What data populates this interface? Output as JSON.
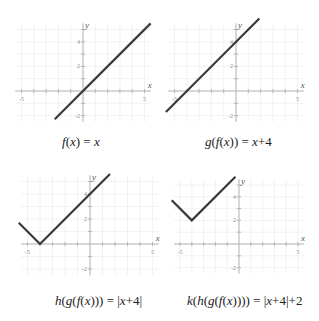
{
  "chart_data": [
    {
      "type": "line",
      "id": "f",
      "title": "f(x) = x",
      "caption_parts": [
        {
          "t": "f",
          "i": true
        },
        {
          "t": "(",
          "i": false
        },
        {
          "t": "x",
          "i": true
        },
        {
          "t": ") = ",
          "i": false
        },
        {
          "t": "x",
          "i": true
        }
      ],
      "xlabel": "x",
      "ylabel": "y",
      "xlim": [
        -5.5,
        5.5
      ],
      "ylim": [
        -2.5,
        5.5
      ],
      "xticks": [
        -5,
        -4,
        -3,
        -2,
        -1,
        1,
        2,
        3,
        4,
        5
      ],
      "xtick_labels": {
        "-5": "-5",
        "5": "5"
      },
      "yticks": [
        -2,
        -1,
        1,
        2,
        3,
        4,
        5
      ],
      "ytick_labels": {
        "-2": "-2",
        "2": "2",
        "4": "4"
      },
      "grid": true,
      "points": [
        [
          -2.3,
          -2.3
        ],
        [
          5.5,
          5.5
        ]
      ],
      "origin_px": [
        83,
        91
      ],
      "unit_px": 12.3,
      "caption_pos": [
        62,
        134
      ]
    },
    {
      "type": "line",
      "id": "g",
      "title": "g(f(x)) = x+4",
      "caption_parts": [
        {
          "t": "g",
          "i": true
        },
        {
          "t": "(",
          "i": false
        },
        {
          "t": "f",
          "i": true
        },
        {
          "t": "(",
          "i": false
        },
        {
          "t": "x",
          "i": true
        },
        {
          "t": ")) = ",
          "i": false
        },
        {
          "t": "x",
          "i": true
        },
        {
          "t": "+4",
          "i": false
        }
      ],
      "xlabel": "x",
      "ylabel": "y",
      "xlim": [
        -5.5,
        5.5
      ],
      "ylim": [
        -2.5,
        5.5
      ],
      "xticks": [
        -5,
        -4,
        -3,
        -2,
        -1,
        1,
        2,
        3,
        4,
        5
      ],
      "xtick_labels": {
        "-5": "-5",
        "5": "5"
      },
      "yticks": [
        -2,
        -1,
        1,
        2,
        3,
        4,
        5
      ],
      "ytick_labels": {
        "-2": "-2",
        "2": "2",
        "4": "4"
      },
      "grid": true,
      "points": [
        [
          -5.7,
          -1.7
        ],
        [
          1.9,
          5.9
        ]
      ],
      "origin_px": [
        236,
        91
      ],
      "unit_px": 12.3,
      "caption_pos": [
        205,
        134
      ]
    },
    {
      "type": "line",
      "id": "h",
      "title": "h(g(f(x))) = |x+4|",
      "caption_parts": [
        {
          "t": "h",
          "i": true
        },
        {
          "t": "(",
          "i": false
        },
        {
          "t": "g",
          "i": true
        },
        {
          "t": "(",
          "i": false
        },
        {
          "t": "f",
          "i": true
        },
        {
          "t": "(",
          "i": false
        },
        {
          "t": "x",
          "i": true
        },
        {
          "t": "))) = |",
          "i": false
        },
        {
          "t": "x",
          "i": true
        },
        {
          "t": "+4|",
          "i": false
        }
      ],
      "xlabel": "x",
      "ylabel": "y",
      "xlim": [
        -5.5,
        5.5
      ],
      "ylim": [
        -2.5,
        5.5
      ],
      "xticks": [
        -5,
        -4,
        -3,
        -2,
        -1,
        1,
        2,
        3,
        4,
        5
      ],
      "xtick_labels": {
        "-5": "-5",
        "5": "5"
      },
      "yticks": [
        -2,
        -1,
        1,
        2,
        3,
        4,
        5
      ],
      "ytick_labels": {
        "-2": "-2",
        "2": "2",
        "4": "4"
      },
      "grid": true,
      "points": [
        [
          -5.7,
          1.7
        ],
        [
          -4,
          0
        ],
        [
          1.6,
          5.6
        ]
      ],
      "origin_px": [
        90,
        244
      ],
      "unit_px": 12.5,
      "caption_pos": [
        55,
        293
      ]
    },
    {
      "type": "line",
      "id": "k",
      "title": "k(h(g(f(x)))) = |x+4|+2",
      "caption_parts": [
        {
          "t": "k",
          "i": true
        },
        {
          "t": "(",
          "i": false
        },
        {
          "t": "h",
          "i": true
        },
        {
          "t": "(",
          "i": false
        },
        {
          "t": "g",
          "i": true
        },
        {
          "t": "(",
          "i": false
        },
        {
          "t": "f",
          "i": true
        },
        {
          "t": "(",
          "i": false
        },
        {
          "t": "x",
          "i": true
        },
        {
          "t": ")))) = |",
          "i": false
        },
        {
          "t": "x",
          "i": true
        },
        {
          "t": "+4|+2",
          "i": false
        }
      ],
      "xlabel": "x",
      "ylabel": "y",
      "xlim": [
        -5.5,
        5.5
      ],
      "ylim": [
        -2.5,
        5.5
      ],
      "xticks": [
        -5,
        -4,
        -3,
        -2,
        -1,
        1,
        2,
        3,
        4,
        5
      ],
      "xtick_labels": {
        "-5": "-5",
        "5": "5"
      },
      "yticks": [
        -2,
        -1,
        1,
        2,
        3,
        4,
        5
      ],
      "ytick_labels": {
        "-2": "-2",
        "2": "2",
        "4": "4"
      },
      "grid": true,
      "points": [
        [
          -5.7,
          3.7
        ],
        [
          -4,
          2
        ],
        [
          -0.3,
          5.7
        ]
      ],
      "origin_px": [
        239,
        244
      ],
      "unit_px": 11.8,
      "caption_pos": [
        187,
        293
      ]
    }
  ],
  "colors": {
    "curve": "#3a3a3a",
    "axis": "#b5b5b5",
    "grid": "#efefef",
    "tick_label": "#8a8a8a",
    "axis_label": "#555555",
    "caption": "#222222"
  }
}
